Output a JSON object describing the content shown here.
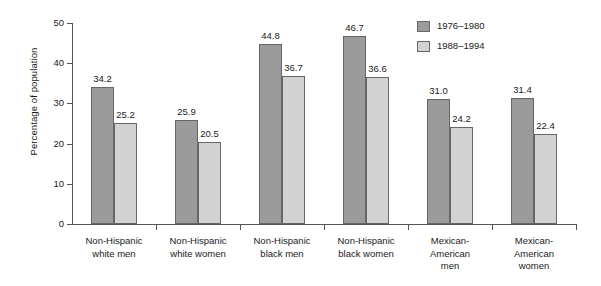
{
  "chart_data": {
    "type": "bar",
    "title": "",
    "xlabel": "",
    "ylabel": "Percentage of population",
    "ylim": [
      0,
      50
    ],
    "yticks": [
      "0",
      "10",
      "20",
      "30",
      "40",
      "50"
    ],
    "grid": false,
    "legend_position": "top-right",
    "categories": [
      "Non-Hispanic\nwhite men",
      "Non-Hispanic\nwhite women",
      "Non-Hispanic\nblack men",
      "Non-Hispanic\nblack women",
      "Mexican-\nAmerican\nmen",
      "Mexican-\nAmerican\nwomen"
    ],
    "category_lines": [
      [
        "Non-Hispanic",
        "white men"
      ],
      [
        "Non-Hispanic",
        "white women"
      ],
      [
        "Non-Hispanic",
        "black men"
      ],
      [
        "Non-Hispanic",
        "black women"
      ],
      [
        "Mexican-",
        "American",
        "men"
      ],
      [
        "Mexican-",
        "American",
        "women"
      ]
    ],
    "series": [
      {
        "name": "1976–1980",
        "color": "#9b9b9b",
        "values": [
          34.2,
          25.9,
          44.8,
          46.7,
          31.0,
          31.4
        ],
        "labels": [
          "34.2",
          "25.9",
          "44.8",
          "46.7",
          "31.0",
          "31.4"
        ]
      },
      {
        "name": "1988–1994",
        "color": "#d2d2d2",
        "values": [
          25.2,
          20.5,
          36.7,
          36.6,
          24.2,
          22.4
        ],
        "labels": [
          "25.2",
          "20.5",
          "36.7",
          "36.6",
          "24.2",
          "22.4"
        ]
      }
    ]
  },
  "legend": {
    "items": [
      {
        "label": "1976–1980",
        "swatch": "dark-gray"
      },
      {
        "label": "1988–1994",
        "swatch": "light-gray"
      }
    ]
  }
}
